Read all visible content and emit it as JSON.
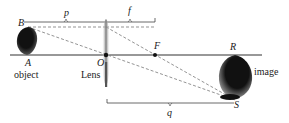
{
  "diagram": {
    "type": "thin-lens ray diagram",
    "labels": {
      "p": "p",
      "f": "f",
      "q": "q",
      "B": "B",
      "A": "A",
      "O": "O",
      "F": "F",
      "R": "R",
      "S": "S",
      "object": "object",
      "lens": "Lens",
      "image": "image"
    },
    "colors": {
      "line": "#333333",
      "dashed": "#666666",
      "object_fill": "#111111",
      "lens_fill": "#888888"
    }
  }
}
